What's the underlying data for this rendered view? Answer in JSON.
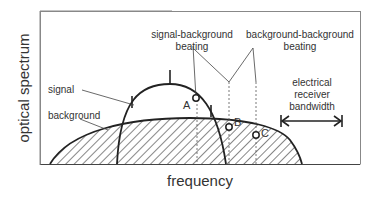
{
  "axes": {
    "ylabel": "optical spectrum",
    "xlabel": "frequency"
  },
  "labels": {
    "signal": "signal",
    "background": "background",
    "sig_bg_line1": "signal-background",
    "sig_bg_line2": "beating",
    "bg_bg_line1": "background-background",
    "bg_bg_line2": "beating",
    "elec_line1": "electrical",
    "elec_line2": "receiver",
    "elec_line3": "bandwidth"
  },
  "points": {
    "A": "A",
    "B": "B",
    "C": "C"
  },
  "colors": {
    "stroke": "#222222",
    "text": "#333333",
    "frame": "#888888"
  }
}
